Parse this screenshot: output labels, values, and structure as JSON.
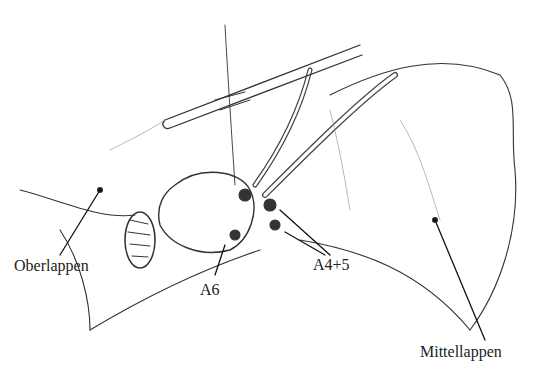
{
  "figure": {
    "labels": {
      "upper_lobe": "Oberlappen",
      "artery_a6": "A6",
      "artery_a45": "A4+5",
      "middle_lobe": "Mittellappen"
    }
  }
}
